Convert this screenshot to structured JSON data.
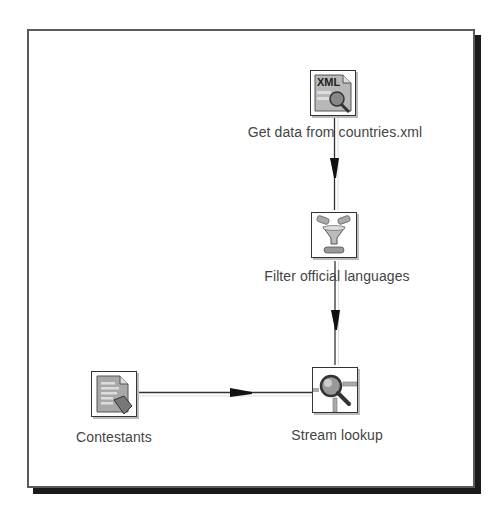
{
  "diagram": {
    "type": "transformation-flow",
    "steps": [
      {
        "id": "xml",
        "label": "Get data from countries.xml",
        "icon": "xml-input-icon"
      },
      {
        "id": "filter",
        "label": "Filter official languages",
        "icon": "filter-funnel-icon"
      },
      {
        "id": "lookup",
        "label": "Stream lookup",
        "icon": "magnifier-lookup-icon"
      },
      {
        "id": "contestants",
        "label": "Contestants",
        "icon": "text-file-input-icon"
      }
    ],
    "hops": [
      {
        "from": "Get data from countries.xml",
        "to": "Filter official languages"
      },
      {
        "from": "Filter official languages",
        "to": "Stream lookup"
      },
      {
        "from": "Contestants",
        "to": "Stream lookup"
      }
    ],
    "colors": {
      "line": "#333333",
      "frame": "#5a5a5a",
      "shadow": "#1a1a1a",
      "text": "#444444"
    }
  }
}
